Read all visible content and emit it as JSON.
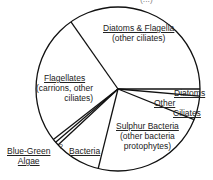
{
  "chart_data": {
    "type": "pie",
    "title": "",
    "cut_off_top_text": "(...)",
    "center": [
      118,
      89
    ],
    "radius": 82,
    "slices": [
      {
        "name": "Diatoms",
        "subtitle": "",
        "start_deg": 0,
        "end_deg": 5,
        "percent": 1.4
      },
      {
        "name": "Other Ciliates",
        "subtitle": "",
        "start_deg": 5,
        "end_deg": 22,
        "percent": 4.7
      },
      {
        "name": "Sulphur Bacteria",
        "subtitle": "(other bacteria protophytes)",
        "start_deg": 22,
        "end_deg": 104,
        "percent": 22.8
      },
      {
        "name": "Bacteria",
        "subtitle": "",
        "start_deg": 104,
        "end_deg": 137,
        "percent": 9.2
      },
      {
        "name": "?",
        "subtitle": "",
        "start_deg": 137,
        "end_deg": 139.5,
        "percent": 0.7
      },
      {
        "name": "Blue-Green Algae",
        "subtitle": "",
        "start_deg": 139.5,
        "end_deg": 142,
        "percent": 0.7
      },
      {
        "name": "Flagellates",
        "subtitle": "(carrions, other ciliates)",
        "start_deg": 142,
        "end_deg": 235,
        "percent": 25.8
      },
      {
        "name": "Diatoms & Flagella",
        "subtitle": "(other ciliates)",
        "start_deg": 235,
        "end_deg": 360,
        "percent": 34.7
      }
    ],
    "legend": "none (labels placed on slices)"
  },
  "labels": {
    "diatoms_flagella": {
      "title": "Diatoms & Flagella",
      "sub": "(other ciliates)"
    },
    "flagellates": {
      "title": "Flagellates",
      "sub1": "(carrions, other",
      "sub2": "ciliates)"
    },
    "diatoms": {
      "title": "Diatoms"
    },
    "other_ciliates": {
      "line1": "Other",
      "line2": "Ciliates"
    },
    "sulphur": {
      "title": "Sulphur Bacteria",
      "sub1": "(other bacteria",
      "sub2": "protophytes)"
    },
    "blue_green": {
      "line1": "Blue-Green",
      "line2": "Algae"
    },
    "bacteria": {
      "title": "Bacteria"
    },
    "unknown": {
      "title": "?"
    }
  },
  "colors": {
    "stroke": "#111111",
    "fill": "#ffffff",
    "text": "#222222"
  }
}
